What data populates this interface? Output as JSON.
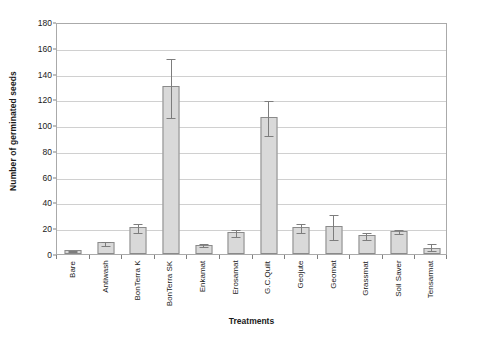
{
  "chart_data": {
    "type": "bar",
    "title": "",
    "xlabel": "Treatments",
    "ylabel": "Number of germinated seeds",
    "ylim": [
      0,
      180
    ],
    "ytick_step": 20,
    "yticks": [
      0,
      20,
      40,
      60,
      80,
      100,
      120,
      140,
      160,
      180
    ],
    "grid": true,
    "legend": false,
    "error_bars": "visible",
    "categories": [
      "Bare",
      "Antiwash",
      "BonTerra K",
      "BonTerra SK",
      "Enkamat",
      "Erosamat",
      "G.C.Quilt",
      "Geojute",
      "Geomat",
      "Grassmat",
      "Soil Saver",
      "Tensarmat"
    ],
    "values": [
      3,
      9,
      21,
      130,
      7,
      17,
      106,
      21,
      22,
      15,
      18,
      5
    ],
    "err_low": [
      2,
      7,
      17,
      106,
      6,
      14,
      92,
      17,
      12,
      12,
      16,
      3
    ],
    "err_high": [
      4,
      11,
      25,
      153,
      9,
      20,
      120,
      25,
      32,
      18,
      20,
      9
    ],
    "bar_fill": "#d9d9d9",
    "bar_edge": "#8a8a8a",
    "grid_color": "#d0d0d0",
    "axis_color": "#aaaaaa"
  }
}
